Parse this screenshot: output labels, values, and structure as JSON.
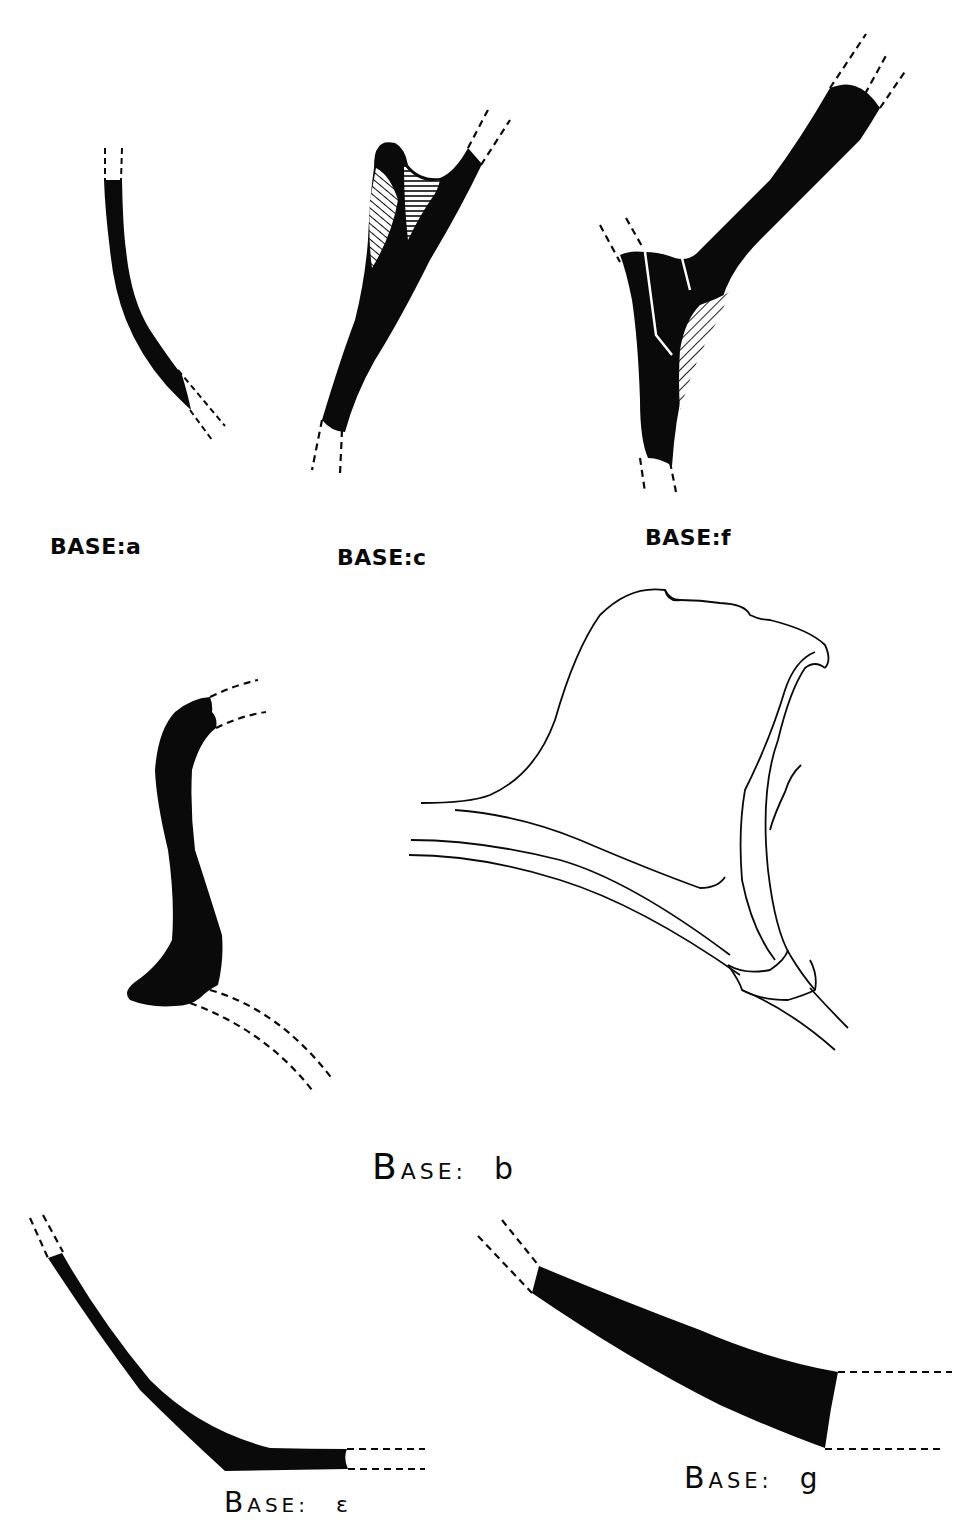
{
  "plate": {
    "background": "#ffffff",
    "ink": "#0a0a0a",
    "figures": [
      {
        "id": "a",
        "label": "BASE:a",
        "render": "solid-profile"
      },
      {
        "id": "c",
        "label": "BASE:c",
        "render": "solid-profile-with-hatching"
      },
      {
        "id": "f",
        "label": "BASE:f",
        "render": "solid-profile-with-hatching"
      },
      {
        "id": "b",
        "label_cap": "B",
        "label_rest": "ASE:",
        "label_suffix": "b",
        "render": "solid-profile-and-outline-drawing"
      },
      {
        "id": "e",
        "label_cap": "B",
        "label_rest": "ASE:",
        "label_suffix": "ε",
        "render": "solid-profile"
      },
      {
        "id": "g",
        "label_cap": "B",
        "label_rest": "ASE:",
        "label_suffix": "g",
        "render": "solid-profile"
      }
    ]
  }
}
